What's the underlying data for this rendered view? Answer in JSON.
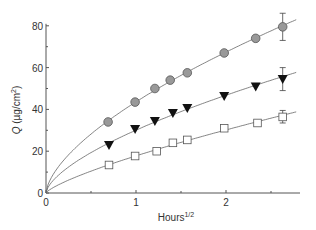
{
  "chart_data": {
    "type": "scatter",
    "title": "",
    "xlabel": "Hours",
    "xlabel_sup": "1/2",
    "ylabel": "Q (µg/cm²)",
    "ylabel_parts": {
      "italic": "Q",
      "rest": " (µg/cm",
      "sup": "2",
      "close": ")"
    },
    "xlim": [
      0,
      2.8
    ],
    "ylim": [
      0,
      85
    ],
    "xticks": [
      0,
      1,
      2
    ],
    "xticks_minor": [
      0.5,
      1.5,
      2.5
    ],
    "yticks": [
      0,
      20,
      40,
      60,
      80
    ],
    "grid": false,
    "legend": "none",
    "series": [
      {
        "name": "circles",
        "marker": "circle-gray",
        "x": [
          0.69,
          0.99,
          1.21,
          1.38,
          1.57,
          1.98,
          2.33,
          2.63
        ],
        "y": [
          34,
          43.5,
          50,
          54,
          57.5,
          67,
          74,
          79.5
        ],
        "error_last": [
          73,
          86
        ]
      },
      {
        "name": "triangles",
        "marker": "triangle-down-black",
        "x": [
          0.7,
          0.99,
          1.21,
          1.41,
          1.57,
          1.98,
          2.33,
          2.63
        ],
        "y": [
          23,
          30.6,
          34.4,
          38.3,
          40.7,
          46.4,
          51,
          54.5
        ],
        "error_last": [
          49,
          60
        ]
      },
      {
        "name": "squares",
        "marker": "square-open",
        "x": [
          0.7,
          0.99,
          1.23,
          1.41,
          1.57,
          1.98,
          2.35,
          2.63
        ],
        "y": [
          13.4,
          17.7,
          20,
          24,
          25.4,
          31,
          33.5,
          36.4
        ],
        "error_last": [
          33.5,
          39.5
        ]
      }
    ],
    "fit_curves": "power-law fits through origin for each series"
  }
}
